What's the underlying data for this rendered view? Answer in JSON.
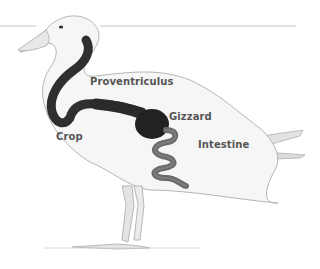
{
  "diagram": {
    "colors": {
      "body_fill": "#f4f4f4",
      "body_outline": "#b8b8b8",
      "tract_dark": "#2f2f2f",
      "intestine": "#6a6a6a",
      "label_text": "#555555",
      "rule_line": "#bdbdbd"
    },
    "labels": [
      {
        "id": "proventriculus",
        "text": "Proventriculus"
      },
      {
        "id": "gizzard",
        "text": "Gizzard"
      },
      {
        "id": "crop",
        "text": "Crop"
      },
      {
        "id": "intestine",
        "text": "Intestine"
      }
    ]
  }
}
